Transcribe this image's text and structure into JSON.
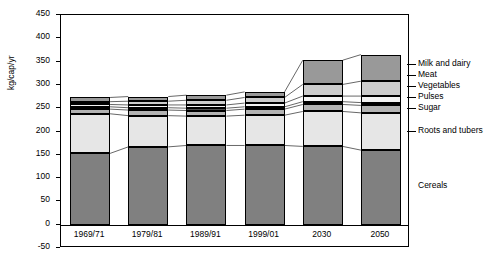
{
  "chart_data": {
    "type": "bar",
    "subtype": "stacked-bar",
    "title": "",
    "xlabel": "",
    "ylabel": "kg/cap/yr",
    "ylim": [
      -50,
      450
    ],
    "yticks": [
      -50,
      0,
      50,
      100,
      150,
      200,
      250,
      300,
      350,
      400,
      450
    ],
    "grid": false,
    "legend_position": "right-outside",
    "categories": [
      "1969/71",
      "1979/81",
      "1989/91",
      "1999/01",
      "2030",
      "2050"
    ],
    "series": [
      {
        "name": "Cereals",
        "values": [
          153,
          167,
          170,
          170,
          168,
          160
        ],
        "color": "#808080"
      },
      {
        "name": "Roots and tubers",
        "values": [
          85,
          67,
          63,
          65,
          75,
          80
        ],
        "color": "#e6e6e6"
      },
      {
        "name": "Sugar",
        "values": [
          10,
          12,
          12,
          13,
          15,
          16
        ],
        "color": "#b3b3b3"
      },
      {
        "name": "Pulses",
        "values": [
          5,
          5,
          5,
          5,
          6,
          6
        ],
        "color": "#4d4d4d"
      },
      {
        "name": "Vegetables",
        "values": [
          5,
          6,
          7,
          8,
          12,
          14
        ],
        "color": "#f2f2f2"
      },
      {
        "name": "Meat",
        "values": [
          6,
          8,
          10,
          12,
          25,
          32
        ],
        "color": "#cccccc"
      },
      {
        "name": "Milk and dairy",
        "values": [
          9,
          10,
          11,
          12,
          52,
          57
        ],
        "color": "#999999"
      }
    ],
    "totals": [
      273,
      275,
      278,
      285,
      353,
      365
    ],
    "annotations": []
  },
  "legend": {
    "items": [
      {
        "label": "Milk and dairy"
      },
      {
        "label": "Meat"
      },
      {
        "label": "Vegetables"
      },
      {
        "label": "Pulses"
      },
      {
        "label": "Sugar"
      },
      {
        "label": "Roots and tubers"
      }
    ]
  },
  "inner_labels": [
    {
      "label": "Cereals"
    }
  ],
  "axis": {
    "y_title": "kg/cap/yr",
    "y_ticks": [
      "450",
      "400",
      "350",
      "300",
      "250",
      "200",
      "150",
      "100",
      "50",
      "0",
      "-50"
    ],
    "x_ticks": [
      "1969/71",
      "1979/81",
      "1989/91",
      "1999/01",
      "2030",
      "2050"
    ]
  }
}
